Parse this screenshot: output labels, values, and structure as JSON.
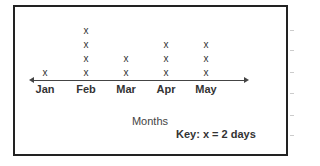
{
  "chart_data": {
    "type": "dot_plot",
    "title": "",
    "categories": [
      "Jan",
      "Feb",
      "Mar",
      "Apr",
      "May"
    ],
    "values": [
      1,
      4,
      2,
      3,
      3
    ],
    "represented_values": [
      2,
      8,
      4,
      6,
      6
    ],
    "marker": "x",
    "xlabel": "Months",
    "ylabel": "",
    "key": "Key:  x = 2 days",
    "grid": false,
    "legend_position": "bottom-right"
  },
  "layout": {
    "category_x": [
      45,
      86,
      126,
      166,
      206
    ]
  }
}
